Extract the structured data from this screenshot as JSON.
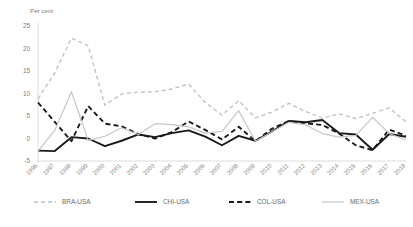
{
  "chart_data": {
    "type": "line",
    "title": "",
    "subtitle": "",
    "ylabel": "Per cent",
    "xlabel": "",
    "ylim": [
      -5,
      25
    ],
    "ytick_values": [
      25,
      20,
      15,
      10,
      5,
      0,
      -5
    ],
    "ytick_labels": [
      "25",
      "20",
      "15",
      "10",
      "5",
      "0",
      "-5"
    ],
    "grid": false,
    "legend_position": "bottom",
    "categories": [
      "1996",
      "1997",
      "1998",
      "1999",
      "2000",
      "2001",
      "2002",
      "2003",
      "2004",
      "2005",
      "2006",
      "2007",
      "2008",
      "2009",
      "2010",
      "2011",
      "2012",
      "2013",
      "2014",
      "2015",
      "2016",
      "2017",
      "2018"
    ],
    "x": [
      1996,
      1997,
      1998,
      1999,
      2000,
      2001,
      2002,
      2003,
      2004,
      2005,
      2006,
      2007,
      2008,
      2009,
      2010,
      2011,
      2012,
      2013,
      2014,
      2015,
      2016,
      2017,
      2018
    ],
    "series": [
      {
        "name": "BRA-USA",
        "color": "#bfbfbf",
        "style": "dashed",
        "width": 1.3,
        "values": [
          8.8,
          14.6,
          22.3,
          20.6,
          7.4,
          9.9,
          10.3,
          10.4,
          11.0,
          12.1,
          8.0,
          5.2,
          8.4,
          4.6,
          5.9,
          7.8,
          6.0,
          4.5,
          5.5,
          4.4,
          5.6,
          6.8,
          3.7
        ]
      },
      {
        "name": "CHI-USA",
        "color": "#1a1a1a",
        "style": "solid",
        "width": 1.9,
        "values": [
          -2.7,
          -2.8,
          0.3,
          0.0,
          -1.7,
          -0.5,
          0.9,
          0.3,
          1.2,
          1.8,
          0.4,
          -1.5,
          0.6,
          -0.5,
          1.6,
          3.9,
          3.6,
          4.1,
          1.2,
          0.9,
          -2.5,
          1.0,
          0.4
        ]
      },
      {
        "name": "COL-USA",
        "color": "#1a1a1a",
        "style": "dashed",
        "width": 1.9,
        "values": [
          8.0,
          3.7,
          -0.6,
          7.2,
          3.3,
          2.7,
          1.0,
          0.0,
          1.4,
          3.8,
          1.9,
          -0.2,
          2.6,
          -0.6,
          2.2,
          3.9,
          3.4,
          3.0,
          1.1,
          -1.5,
          -2.6,
          2.0,
          0.6
        ]
      },
      {
        "name": "MEX-USA",
        "color": "#c7c7c7",
        "style": "solid",
        "width": 1.2,
        "values": [
          -2.8,
          1.8,
          10.4,
          -0.4,
          0.5,
          2.4,
          0.9,
          3.3,
          3.1,
          2.6,
          1.2,
          1.6,
          6.2,
          -0.6,
          1.5,
          3.6,
          3.0,
          1.1,
          0.3,
          0.7,
          4.7,
          1.1,
          -0.4
        ]
      }
    ]
  },
  "legend": {
    "items": [
      {
        "label": "BRA-USA"
      },
      {
        "label": "CHI-USA"
      },
      {
        "label": "COL-USA"
      },
      {
        "label": "MEX-USA"
      }
    ]
  }
}
